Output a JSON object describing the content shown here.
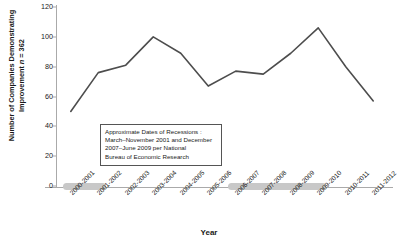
{
  "chart_data": {
    "type": "line",
    "title": "",
    "xlabel": "Year",
    "ylabel": "Number of Companies Demonstrating Improvement n = 362",
    "ylabel_prefix": "Number of Companies Demonstrating Improvement ",
    "ylabel_italic": "n",
    "ylabel_suffix": " = 362",
    "n": 362,
    "categories": [
      "2000-2001",
      "2001-2002",
      "2002-2003",
      "2003-2004",
      "2004-2005",
      "2005-2006",
      "2006-2007",
      "2007-2008",
      "2008-2009",
      "2009-2010",
      "2010-2011",
      "2011-2012"
    ],
    "values": [
      50,
      76,
      81,
      100,
      89,
      67,
      77,
      75,
      89,
      106,
      80,
      57
    ],
    "ylim": [
      0,
      120
    ],
    "yticks": [
      0,
      20,
      40,
      60,
      80,
      100,
      120
    ],
    "grid": false,
    "legend": "none",
    "line_color": "#4d4d4d",
    "band_color": "#c8c8c8",
    "annotation": {
      "lines": [
        "Approximate Dates of Recessions :",
        "March–November 2001 and December",
        "2007–June 2009 per National",
        "Bureau of Economic Research"
      ]
    },
    "recession_bands": [
      {
        "name": "recession-2001",
        "start_category": "2000-2001",
        "end_category": "2001-2002"
      },
      {
        "name": "recession-2007-2009",
        "start_category": "2006-2007",
        "end_category": "2009-2010"
      }
    ]
  }
}
